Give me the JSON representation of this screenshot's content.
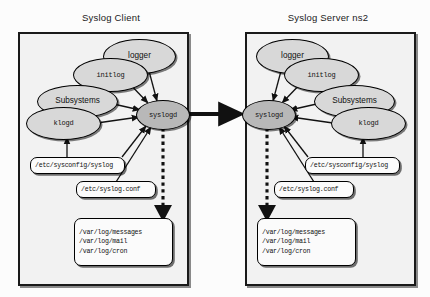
{
  "diagram": {
    "title_left": "Syslog Client",
    "title_right": "Syslog Server ns2",
    "colors": {
      "node_fill": "#d8d8d8",
      "node_fill_active": "#b8b8b8",
      "panel_fill": "#f2f2f2",
      "stroke": "#000000",
      "page_bg": "#fcfcfc"
    }
  },
  "client": {
    "nodes": {
      "logger": "logger",
      "initlog": "initlog",
      "subsystems": "Subsystems",
      "klogd": "klogd",
      "syslogd": "syslogd"
    },
    "files": {
      "sysconfig": "/etc/sysconfig/syslog",
      "conf": "/etc/syslog.conf",
      "logs": [
        "/var/log/messages",
        "/var/log/mail",
        "/var/log/cron"
      ]
    }
  },
  "server": {
    "nodes": {
      "logger": "logger",
      "initlog": "initlog",
      "subsystems": "Subsystems",
      "klogd": "klogd",
      "syslogd": "syslogd"
    },
    "files": {
      "sysconfig": "/etc/sysconfig/syslog",
      "conf": "/etc/syslog.conf",
      "logs": [
        "/var/log/messages",
        "/var/log/mail",
        "/var/log/cron"
      ]
    }
  }
}
